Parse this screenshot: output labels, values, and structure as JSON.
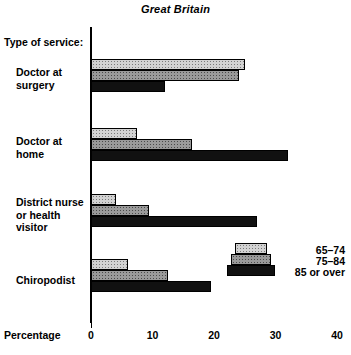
{
  "chart_data": {
    "type": "bar",
    "orientation": "horizontal",
    "title": "Great Britain",
    "xlabel": "Percentage",
    "ylabel": "Type of service:",
    "xlim": [
      0,
      40
    ],
    "xticks": [
      "0",
      "10",
      "20",
      "30",
      "40"
    ],
    "grid": false,
    "legend_position": "inside-right",
    "categories": [
      "Doctor at\nsurgery",
      "Doctor at\nhome",
      "District nurse\nor health\nvisitor",
      "Chiropodist"
    ],
    "series": [
      {
        "name": "65–74",
        "color": "#d2d2d2",
        "values": [
          25,
          7.5,
          4,
          6
        ]
      },
      {
        "name": "75–84",
        "color": "#9a9a9a",
        "values": [
          24,
          16.5,
          9.5,
          12.5
        ]
      },
      {
        "name": "85 or over",
        "color": "#111111",
        "values": [
          12,
          32,
          27,
          19.5
        ]
      }
    ]
  },
  "legend": {
    "entries": [
      {
        "label": "65–74"
      },
      {
        "label": "75–84"
      },
      {
        "label": "85 or over"
      }
    ]
  },
  "axis": {
    "caption": "Percentage",
    "category_header": "Type of service:",
    "ticks": [
      "0",
      "10",
      "20",
      "30",
      "40"
    ]
  }
}
